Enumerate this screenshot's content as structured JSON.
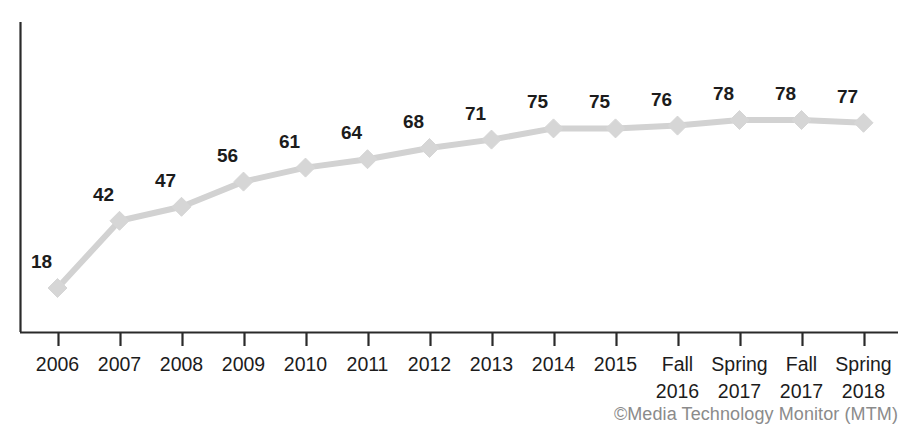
{
  "chart_data": {
    "type": "line",
    "title_visible_fragment": "",
    "xlabel": "",
    "ylabel": "",
    "categories": [
      "2006",
      "2007",
      "2008",
      "2009",
      "2010",
      "2011",
      "2012",
      "2013",
      "2014",
      "2015",
      "Fall\n2016",
      "Spring\n2017",
      "Fall\n2017",
      "Spring\n2018"
    ],
    "tick_labels": [
      {
        "line1": "2006",
        "line2": ""
      },
      {
        "line1": "2007",
        "line2": ""
      },
      {
        "line1": "2008",
        "line2": ""
      },
      {
        "line1": "2009",
        "line2": ""
      },
      {
        "line1": "2010",
        "line2": ""
      },
      {
        "line1": "2011",
        "line2": ""
      },
      {
        "line1": "2012",
        "line2": ""
      },
      {
        "line1": "2013",
        "line2": ""
      },
      {
        "line1": "2014",
        "line2": ""
      },
      {
        "line1": "2015",
        "line2": ""
      },
      {
        "line1": "Fall",
        "line2": "2016"
      },
      {
        "line1": "Spring",
        "line2": "2017"
      },
      {
        "line1": "Fall",
        "line2": "2017"
      },
      {
        "line1": "Spring",
        "line2": "2018"
      }
    ],
    "values": [
      18,
      42,
      47,
      56,
      61,
      64,
      68,
      71,
      75,
      75,
      76,
      78,
      78,
      77
    ],
    "data_labels": [
      "18",
      "42",
      "47",
      "56",
      "61",
      "64",
      "68",
      "71",
      "75",
      "75",
      "76",
      "78",
      "78",
      "77"
    ],
    "ylim": [
      0,
      100
    ],
    "grid": false,
    "legend": null,
    "series": [
      {
        "name": "Smartphone use",
        "values": [
          18,
          42,
          47,
          56,
          61,
          64,
          68,
          71,
          75,
          75,
          76,
          78,
          78,
          77
        ],
        "marker": "diamond",
        "line_color": "#d2d2d2",
        "marker_color": "#d6d6d6"
      }
    ]
  },
  "colors": {
    "line": "#d2d2d2",
    "marker": "#d6d6d6",
    "axis": "#2a2a2a",
    "label_text": "#1c1c1c",
    "credit_text": "#8b8b8b",
    "background": "#ffffff"
  },
  "credit": {
    "text": "©Media Technology Monitor (MTM)"
  }
}
